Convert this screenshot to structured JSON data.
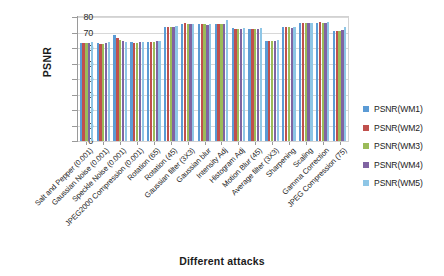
{
  "chart_data": {
    "type": "bar",
    "title": "",
    "xlabel": "Different attacks",
    "ylabel": "PSNR",
    "ylim": [
      0,
      80
    ],
    "yticks": [
      0,
      10,
      20,
      30,
      40,
      50,
      60,
      70,
      80
    ],
    "grid": true,
    "legend_position": "right",
    "categories": [
      "Salt and Pepper (0.001)",
      "Gaussian Noise (0.001)",
      "Speckle Noise (0.001)",
      "JPEG2000 Compression (0.001)",
      "Rotation (65)",
      "Rotation (45)",
      "Gaussian filter (3X3)",
      "Gaussian blur",
      "Intensity Adj",
      "Histogram Adj",
      "Motion Blur (45)",
      "Average filter (3X3)",
      "Sharpening",
      "Scaling",
      "Gamma Correction",
      "JPEG Compression (75)"
    ],
    "series": [
      {
        "name": "PSNR(WM1)",
        "color": "#5b9bd5",
        "values": [
          63.5,
          63.3,
          68.3,
          63.6,
          63.9,
          73.5,
          75.4,
          75.2,
          75.2,
          72.6,
          72.5,
          64.7,
          73.3,
          76.2,
          76.3,
          71.2
        ]
      },
      {
        "name": "PSNR(WM2)",
        "color": "#c0504d",
        "values": [
          63.4,
          62.6,
          66.6,
          63.4,
          64.0,
          73.6,
          75.9,
          75.4,
          75.4,
          72.5,
          72.4,
          64.6,
          73.6,
          76.4,
          76.5,
          71.0
        ]
      },
      {
        "name": "PSNR(WM3)",
        "color": "#9bbb59",
        "values": [
          63.2,
          62.5,
          65.2,
          63.5,
          64.2,
          73.5,
          75.6,
          75.2,
          75.5,
          72.4,
          72.4,
          64.5,
          73.4,
          76.1,
          76.4,
          71.3
        ]
      },
      {
        "name": "PSNR(WM4)",
        "color": "#8064a2",
        "values": [
          63.3,
          63.1,
          64.3,
          63.6,
          64.3,
          73.4,
          75.2,
          75.1,
          75.3,
          72.3,
          72.3,
          64.4,
          73.2,
          75.9,
          76.2,
          71.6
        ]
      },
      {
        "name": "PSNR(WM5)",
        "color": "#8ec6e6",
        "values": [
          63.9,
          63.9,
          64.1,
          64.2,
          64.6,
          74.0,
          75.6,
          75.3,
          78.2,
          72.8,
          72.7,
          65.0,
          73.5,
          76.3,
          76.6,
          73.6
        ]
      }
    ]
  }
}
